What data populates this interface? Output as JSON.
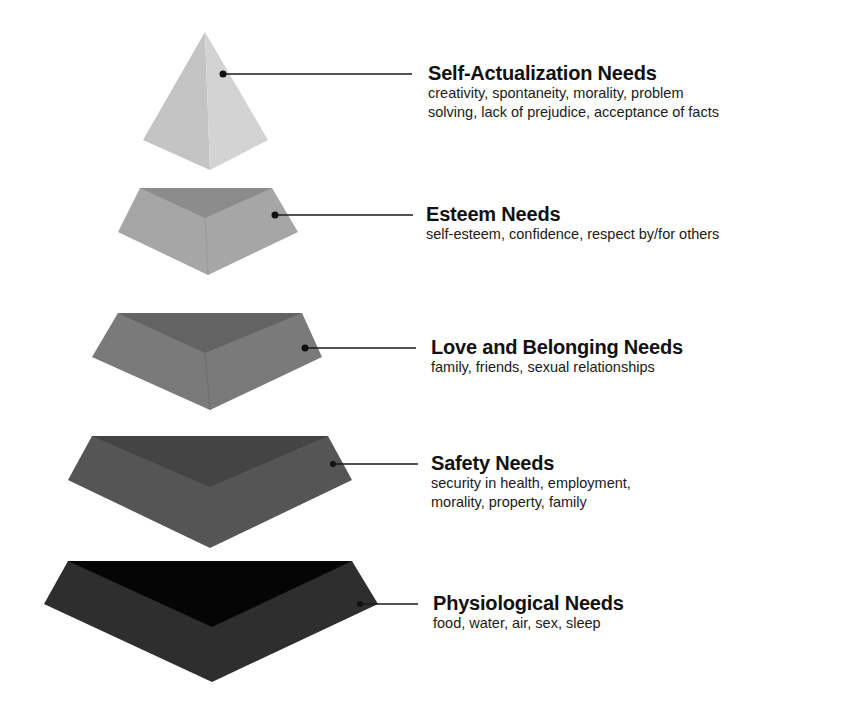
{
  "diagram": {
    "type": "stacked-pyramid",
    "levels": [
      {
        "id": "self-actualization",
        "title": "Self-Actualization Needs",
        "description": "creativity, spontaneity, morality, problem\nsolving, lack of prejudice, acceptance of facts",
        "colors": {
          "left": "#c4c4c4",
          "right": "#d3d3d3"
        }
      },
      {
        "id": "esteem",
        "title": "Esteem Needs",
        "description": "self-esteem, confidence, respect by/for others",
        "colors": {
          "outer": "#a6a6a6",
          "inner": "#8c8c8c"
        }
      },
      {
        "id": "love-belonging",
        "title": "Love and Belonging Needs",
        "description": "family, friends, sexual relationships",
        "colors": {
          "outer": "#7a7a7a",
          "inner": "#636363"
        }
      },
      {
        "id": "safety",
        "title": "Safety Needs",
        "description": "security in health, employment,\nmorality, property, family",
        "colors": {
          "outer": "#555555",
          "inner": "#444444"
        }
      },
      {
        "id": "physiological",
        "title": "Physiological Needs",
        "description": "food, water, air, sex, sleep",
        "colors": {
          "outer": "#2e2e2e",
          "inner": "#050505"
        }
      }
    ]
  }
}
